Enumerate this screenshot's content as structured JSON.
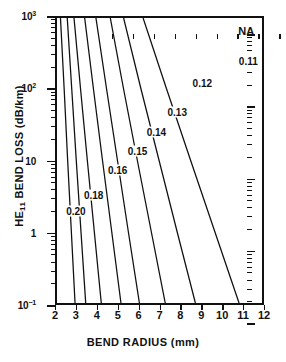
{
  "chart_data": {
    "type": "line",
    "title": "",
    "xlabel": "BEND RADIUS (mm)",
    "ylabel": "HE11 BEND LOSS (dB/km)",
    "ylabel_prefix": "HE",
    "ylabel_sub": "11",
    "ylabel_suffix": " BEND LOSS (dB/km)",
    "xscale": "linear",
    "yscale": "log",
    "xlim": [
      2,
      12
    ],
    "ylim": [
      0.1,
      1000
    ],
    "grid": false,
    "legend_position": "inline-labels",
    "legend_title": "NA",
    "xticks": [
      2,
      3,
      4,
      5,
      6,
      7,
      8,
      9,
      10,
      11,
      12
    ],
    "xticklabels": [
      "2",
      "3",
      "4",
      "5",
      "6",
      "7",
      "8",
      "9",
      "10",
      "11",
      "12"
    ],
    "yticks": [
      0.1,
      1,
      10,
      100,
      1000
    ],
    "yticklabels": [
      "10⁻¹",
      "1",
      "10",
      "10²",
      "10³"
    ],
    "ytick_mantissas": [
      "10",
      "1",
      "10",
      "10",
      "10"
    ],
    "ytick_exponents": [
      "-1",
      "",
      "",
      "2",
      "3"
    ],
    "annotations": [
      {
        "text": "NA",
        "x": 11.15,
        "y": 620
      },
      {
        "text": "0.11",
        "x": 11.25,
        "y": 235
      },
      {
        "text": "0.12",
        "x": 9.05,
        "y": 120
      },
      {
        "text": "0.13",
        "x": 7.85,
        "y": 47
      },
      {
        "text": "0.14",
        "x": 6.85,
        "y": 25
      },
      {
        "text": "0.15",
        "x": 5.95,
        "y": 13.5
      },
      {
        "text": "0.16",
        "x": 5.0,
        "y": 7.5
      },
      {
        "text": "0.18",
        "x": 3.85,
        "y": 3.3
      },
      {
        "text": "0.20",
        "x": 3.0,
        "y": 2.0
      }
    ],
    "series": [
      {
        "name": "0.20",
        "na": 0.2,
        "points": [
          [
            2.17,
            1000
          ],
          [
            2.35,
            100
          ],
          [
            2.52,
            10
          ],
          [
            2.7,
            1
          ],
          [
            2.88,
            0.1
          ]
        ]
      },
      {
        "name": "0.18",
        "na": 0.18,
        "points": [
          [
            2.5,
            1000
          ],
          [
            2.72,
            100
          ],
          [
            2.94,
            10
          ],
          [
            3.17,
            1
          ],
          [
            3.4,
            0.1
          ]
        ]
      },
      {
        "name": "0.16",
        "na": 0.16,
        "points": [
          [
            2.83,
            1000
          ],
          [
            3.15,
            100
          ],
          [
            3.48,
            10
          ],
          [
            3.82,
            1
          ],
          [
            4.16,
            0.1
          ]
        ]
      },
      {
        "name": "0.15",
        "na": 0.15,
        "points": [
          [
            3.35,
            1000
          ],
          [
            3.78,
            100
          ],
          [
            4.22,
            10
          ],
          [
            4.67,
            1
          ],
          [
            5.12,
            0.1
          ]
        ]
      },
      {
        "name": "0.14",
        "na": 0.14,
        "points": [
          [
            3.9,
            1000
          ],
          [
            4.42,
            100
          ],
          [
            4.95,
            10
          ],
          [
            5.48,
            1
          ],
          [
            6.02,
            0.1
          ]
        ]
      },
      {
        "name": "0.13",
        "na": 0.13,
        "points": [
          [
            4.6,
            1000
          ],
          [
            5.25,
            100
          ],
          [
            5.92,
            10
          ],
          [
            6.6,
            1
          ],
          [
            7.28,
            0.1
          ]
        ]
      },
      {
        "name": "0.12",
        "na": 0.12,
        "points": [
          [
            5.25,
            1000
          ],
          [
            6.1,
            100
          ],
          [
            6.98,
            10
          ],
          [
            7.86,
            1
          ],
          [
            8.75,
            0.1
          ]
        ]
      },
      {
        "name": "0.11",
        "na": 0.11,
        "points": [
          [
            6.2,
            1000
          ],
          [
            7.35,
            100
          ],
          [
            8.52,
            10
          ],
          [
            9.7,
            1
          ],
          [
            10.88,
            0.1
          ]
        ]
      }
    ]
  }
}
